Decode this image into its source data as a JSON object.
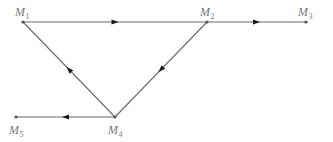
{
  "diagram": {
    "type": "directed-graph",
    "nodes": [
      {
        "id": "M1",
        "base": "M",
        "sub": "1"
      },
      {
        "id": "M2",
        "base": "M",
        "sub": "2"
      },
      {
        "id": "M3",
        "base": "M",
        "sub": "3"
      },
      {
        "id": "M4",
        "base": "M",
        "sub": "4"
      },
      {
        "id": "M5",
        "base": "M",
        "sub": "5"
      }
    ],
    "edges": [
      {
        "from": "M1",
        "to": "M2"
      },
      {
        "from": "M2",
        "to": "M3"
      },
      {
        "from": "M2",
        "to": "M4"
      },
      {
        "from": "M4",
        "to": "M1"
      },
      {
        "from": "M4",
        "to": "M5"
      }
    ],
    "colors": {
      "line": "#6a6a6a",
      "arrow": "#1a1a1a",
      "label": "#7a7a7a"
    }
  }
}
